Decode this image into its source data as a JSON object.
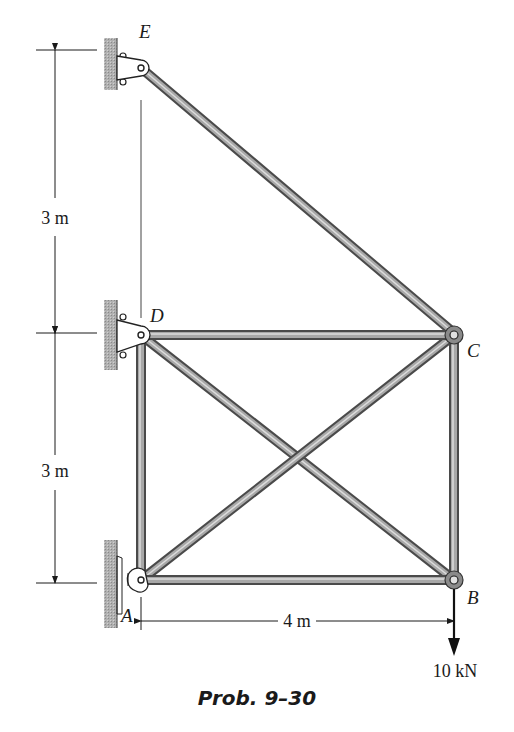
{
  "figure": {
    "caption": "Prob. 9–30",
    "type": "truss"
  },
  "joints": {
    "A": {
      "label": "A",
      "support": "pin to wall"
    },
    "B": {
      "label": "B"
    },
    "C": {
      "label": "C"
    },
    "D": {
      "label": "D",
      "support": "pin to wall"
    },
    "E": {
      "label": "E",
      "support": "pin to wall"
    }
  },
  "members": [
    "EC",
    "DC",
    "AB",
    "DA",
    "CB",
    "DB",
    "AC"
  ],
  "dimensions": {
    "upper_vertical": "3 m",
    "lower_vertical": "3 m",
    "horizontal": "4 m"
  },
  "load": {
    "label": "10 kN",
    "joint": "B",
    "direction": "down"
  },
  "colors": {
    "member_dark": "#555555",
    "member_light": "#bdbdbd",
    "wall": "#9a9a9a",
    "line": "#1a1a1a"
  }
}
